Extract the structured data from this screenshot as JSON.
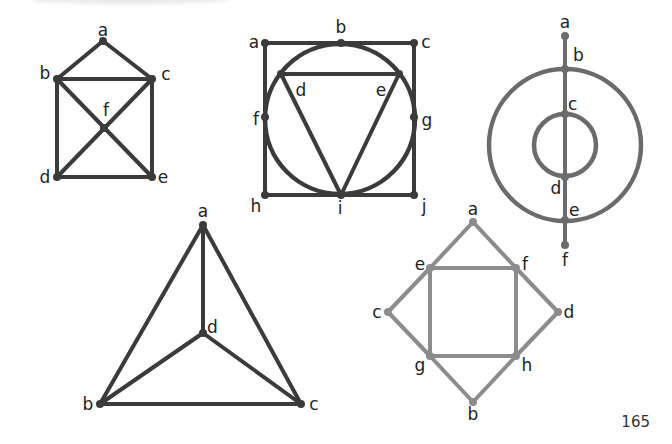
{
  "page": {
    "number": "165"
  },
  "colors": {
    "dark": "#3b3b3b",
    "medium": "#6b6b6b",
    "light": "#8c8c8c",
    "label": "#232323"
  },
  "graphs": [
    {
      "id": "graph-house",
      "color": "#3b3b3b",
      "nodes": [
        {
          "id": "a",
          "x": 103,
          "y": 41,
          "lx": 103,
          "ly": 36,
          "anchor": "middle"
        },
        {
          "id": "b",
          "x": 57,
          "y": 79,
          "lx": 45,
          "ly": 79,
          "anchor": "middle"
        },
        {
          "id": "c",
          "x": 152,
          "y": 79,
          "lx": 166,
          "ly": 80,
          "anchor": "middle"
        },
        {
          "id": "f",
          "x": 104,
          "y": 128,
          "lx": 106,
          "ly": 116,
          "anchor": "middle"
        },
        {
          "id": "d",
          "x": 57,
          "y": 177,
          "lx": 45,
          "ly": 183,
          "anchor": "middle"
        },
        {
          "id": "e",
          "x": 152,
          "y": 177,
          "lx": 163,
          "ly": 183,
          "anchor": "middle"
        }
      ],
      "edges": [
        [
          "a",
          "b"
        ],
        [
          "a",
          "c"
        ],
        [
          "b",
          "c"
        ],
        [
          "b",
          "d"
        ],
        [
          "c",
          "e"
        ],
        [
          "d",
          "e"
        ],
        [
          "b",
          "e"
        ],
        [
          "c",
          "d"
        ]
      ],
      "circles": []
    },
    {
      "id": "graph-square-circle-triangle",
      "color": "#3b3b3b",
      "nodes": [
        {
          "id": "a",
          "x": 265,
          "y": 43,
          "lx": 254,
          "ly": 48,
          "anchor": "middle"
        },
        {
          "id": "b",
          "x": 341,
          "y": 43,
          "lx": 341,
          "ly": 33,
          "anchor": "middle"
        },
        {
          "id": "c",
          "x": 414,
          "y": 43,
          "lx": 426,
          "ly": 48,
          "anchor": "middle"
        },
        {
          "id": "d",
          "x": 281,
          "y": 74,
          "lx": 301,
          "ly": 96,
          "anchor": "middle"
        },
        {
          "id": "e",
          "x": 399,
          "y": 74,
          "lx": 381,
          "ly": 96,
          "anchor": "middle"
        },
        {
          "id": "f",
          "x": 265,
          "y": 117,
          "lx": 256,
          "ly": 125,
          "anchor": "middle"
        },
        {
          "id": "g",
          "x": 414,
          "y": 117,
          "lx": 427,
          "ly": 126,
          "anchor": "middle"
        },
        {
          "id": "h",
          "x": 265,
          "y": 195,
          "lx": 256,
          "ly": 212,
          "anchor": "middle"
        },
        {
          "id": "i",
          "x": 341,
          "y": 195,
          "lx": 340,
          "ly": 214,
          "anchor": "middle"
        },
        {
          "id": "j",
          "x": 414,
          "y": 195,
          "lx": 424,
          "ly": 212,
          "anchor": "middle"
        }
      ],
      "edges": [
        [
          "a",
          "b"
        ],
        [
          "b",
          "c"
        ],
        [
          "a",
          "f"
        ],
        [
          "f",
          "h"
        ],
        [
          "c",
          "g"
        ],
        [
          "g",
          "j"
        ],
        [
          "h",
          "i"
        ],
        [
          "i",
          "j"
        ],
        [
          "d",
          "e"
        ],
        [
          "d",
          "i"
        ],
        [
          "e",
          "i"
        ]
      ],
      "circles": [
        {
          "cx": 340,
          "cy": 119,
          "r": 75
        }
      ]
    },
    {
      "id": "graph-concentric-circles",
      "color": "#6b6b6b",
      "nodes": [
        {
          "id": "a",
          "x": 565,
          "y": 36,
          "lx": 565,
          "ly": 28,
          "anchor": "middle"
        },
        {
          "id": "b",
          "x": 565,
          "y": 69,
          "lx": 573,
          "ly": 61,
          "anchor": "start"
        },
        {
          "id": "c",
          "x": 565,
          "y": 114,
          "lx": 568,
          "ly": 110,
          "anchor": "start"
        },
        {
          "id": "d",
          "x": 565,
          "y": 177,
          "lx": 556,
          "ly": 194,
          "anchor": "middle"
        },
        {
          "id": "e",
          "x": 565,
          "y": 220,
          "lx": 569,
          "ly": 216,
          "anchor": "start"
        },
        {
          "id": "f",
          "x": 565,
          "y": 245,
          "lx": 565,
          "ly": 266,
          "anchor": "middle"
        }
      ],
      "edges": [
        [
          "a",
          "f"
        ]
      ],
      "circles": [
        {
          "cx": 565,
          "cy": 145,
          "r": 76
        },
        {
          "cx": 565,
          "cy": 145,
          "r": 31
        }
      ]
    },
    {
      "id": "graph-triangle-center",
      "color": "#3b3b3b",
      "nodes": [
        {
          "id": "a",
          "x": 203,
          "y": 225,
          "lx": 203,
          "ly": 217,
          "anchor": "middle"
        },
        {
          "id": "d",
          "x": 203,
          "y": 333,
          "lx": 207,
          "ly": 333,
          "anchor": "start"
        },
        {
          "id": "b",
          "x": 100,
          "y": 404,
          "lx": 88,
          "ly": 410,
          "anchor": "middle"
        },
        {
          "id": "c",
          "x": 301,
          "y": 404,
          "lx": 314,
          "ly": 410,
          "anchor": "middle"
        }
      ],
      "edges": [
        [
          "a",
          "b"
        ],
        [
          "a",
          "c"
        ],
        [
          "b",
          "c"
        ],
        [
          "a",
          "d"
        ],
        [
          "b",
          "d"
        ],
        [
          "c",
          "d"
        ]
      ],
      "circles": []
    },
    {
      "id": "graph-diamond-square",
      "color": "#8c8c8c",
      "nodes": [
        {
          "id": "a",
          "x": 473,
          "y": 222,
          "lx": 473,
          "ly": 215,
          "anchor": "middle"
        },
        {
          "id": "e",
          "x": 430,
          "y": 268,
          "lx": 420,
          "ly": 270,
          "anchor": "middle"
        },
        {
          "id": "f",
          "x": 516,
          "y": 268,
          "lx": 525,
          "ly": 270,
          "anchor": "middle"
        },
        {
          "id": "c",
          "x": 388,
          "y": 312,
          "lx": 377,
          "ly": 318,
          "anchor": "middle"
        },
        {
          "id": "d",
          "x": 558,
          "y": 312,
          "lx": 569,
          "ly": 318,
          "anchor": "middle"
        },
        {
          "id": "g",
          "x": 430,
          "y": 356,
          "lx": 420,
          "ly": 371,
          "anchor": "middle"
        },
        {
          "id": "h",
          "x": 516,
          "y": 356,
          "lx": 527,
          "ly": 371,
          "anchor": "middle"
        },
        {
          "id": "b",
          "x": 473,
          "y": 402,
          "lx": 473,
          "ly": 420,
          "anchor": "middle"
        }
      ],
      "edges": [
        [
          "a",
          "e"
        ],
        [
          "a",
          "f"
        ],
        [
          "e",
          "c"
        ],
        [
          "f",
          "d"
        ],
        [
          "c",
          "g"
        ],
        [
          "d",
          "h"
        ],
        [
          "g",
          "b"
        ],
        [
          "h",
          "b"
        ],
        [
          "e",
          "f"
        ],
        [
          "f",
          "h"
        ],
        [
          "h",
          "g"
        ],
        [
          "g",
          "e"
        ]
      ],
      "circles": []
    }
  ]
}
